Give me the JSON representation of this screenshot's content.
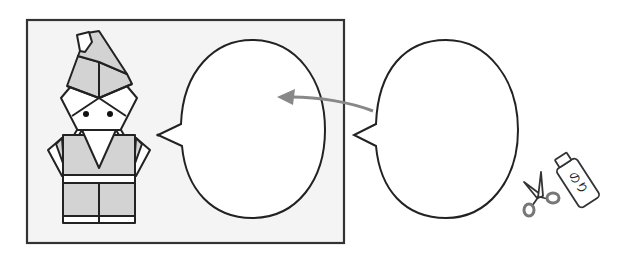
{
  "figure": {
    "frame": {
      "fill": "#f4f4f4",
      "stroke": "#333333"
    },
    "character": {
      "name": "origami-dwarf",
      "fill_shade": "#d3d3d3",
      "stroke": "#222222"
    },
    "bubble_inside": {
      "text": ""
    },
    "bubble_outside": {
      "text": ""
    },
    "arrow": {
      "color": "#888888",
      "direction": "right-to-left"
    },
    "tools": {
      "scissors_label": "scissors",
      "glue_label": "のり"
    }
  }
}
